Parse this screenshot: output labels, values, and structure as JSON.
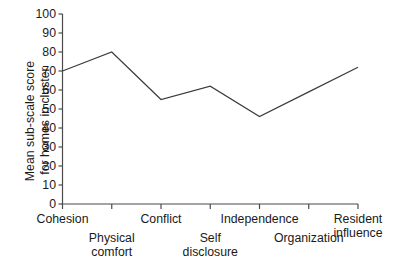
{
  "chart_data": {
    "type": "line",
    "title": "",
    "xlabel": "",
    "ylabel": "Mean sub-scale score for homes in cluster",
    "ylabel_lines": [
      "Mean sub-scale score",
      "for homes in cluster"
    ],
    "categories": [
      "Cohesion",
      "Physical comfort",
      "Conflict",
      "Self disclosure",
      "Independence",
      "Organization",
      "Resident influence"
    ],
    "category_lines": [
      [
        "Cohesion"
      ],
      [
        "Physical",
        "comfort"
      ],
      [
        "Conflict"
      ],
      [
        "Self",
        "disclosure"
      ],
      [
        "Independence"
      ],
      [
        "Organization"
      ],
      [
        "Resident",
        "influence"
      ]
    ],
    "values": [
      70,
      80,
      55,
      62,
      46,
      59,
      72
    ],
    "ylim": [
      0,
      100
    ],
    "yticks": [
      0,
      10,
      20,
      30,
      40,
      50,
      60,
      70,
      80,
      90,
      100
    ],
    "ytick_labels": [
      "0",
      "10",
      "20",
      "30",
      "40",
      "50",
      "60",
      "70",
      "80",
      "90",
      "100"
    ],
    "grid": false,
    "legend": null,
    "line_color": "#3c3c3c",
    "axis_color": "#4a4a4a",
    "background": "#ffffff"
  }
}
